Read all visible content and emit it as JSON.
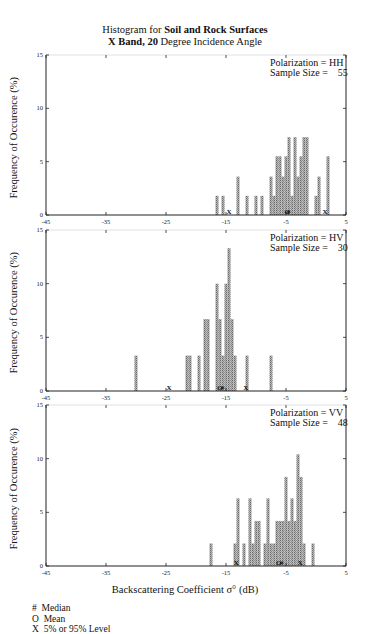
{
  "title_line1_prefix": "Histogram for ",
  "title_line1_bold": "Soil and Rock Surfaces",
  "title_line2_bold1": "X Band, 20",
  "title_line2_rest": " Degree Incidence Angle",
  "ylabel": "Frequency of Occurence (%)",
  "xlabel": "Backscattering Coefficient  σ° (dB)",
  "legend": [
    {
      "symbol": "#",
      "label": "Median"
    },
    {
      "symbol": "O",
      "label": "Mean"
    },
    {
      "symbol": "X",
      "label": "5% or 95% Level"
    }
  ],
  "chart_data": [
    {
      "type": "bar",
      "title": "Polarization = HH",
      "polarization": "HH",
      "sample_size": 55,
      "xlabel": "Backscattering Coefficient σ° (dB)",
      "ylabel": "Frequency of Occurence (%)",
      "xlim": [
        -45,
        5
      ],
      "ylim": [
        0,
        15
      ],
      "xticks": [
        -45,
        -35,
        -25,
        -15,
        -5,
        5
      ],
      "yticks": [
        0,
        5,
        10,
        15
      ],
      "bin_width_db": 1,
      "bins": [
        -16,
        -15,
        -13,
        -11,
        -10,
        -9,
        -8,
        -7,
        -6,
        -5,
        -4,
        -3,
        -2,
        -1,
        1,
        2,
        3
      ],
      "values": [
        1.8,
        1.8,
        3.6,
        1.8,
        1.8,
        1.8,
        3.6,
        5.5,
        5.5,
        7.3,
        7.3,
        5.5,
        7.3,
        1.8,
        5.5,
        1.8,
        1.8
      ],
      "detail_bins": [
        -16.5,
        -15.5,
        -13.0,
        -11.5,
        -10.0,
        -9.0,
        -7.5,
        -7.0,
        -6.5,
        -6.0,
        -5.5,
        -5.0,
        -4.5,
        -4.0,
        -3.5,
        -3.0,
        -2.5,
        -2.0,
        -1.5,
        0.0,
        0.5,
        2.0
      ],
      "detail_values": [
        1.8,
        1.8,
        3.6,
        1.8,
        1.8,
        1.8,
        3.6,
        1.8,
        5.5,
        5.5,
        3.6,
        5.5,
        7.3,
        1.8,
        7.3,
        3.6,
        5.5,
        7.3,
        7.3,
        1.8,
        3.6,
        5.5
      ],
      "markers": [
        {
          "symbol": "X",
          "x": -14.5,
          "meaning": "5% level"
        },
        {
          "symbol": "#",
          "x": -4.6,
          "meaning": "median"
        },
        {
          "symbol": "O",
          "x": -4.8,
          "meaning": "mean"
        },
        {
          "symbol": "X",
          "x": 1.5,
          "meaning": "95% level"
        }
      ]
    },
    {
      "type": "bar",
      "title": "Polarization = HV",
      "polarization": "HV",
      "sample_size": 30,
      "xlim": [
        -45,
        5
      ],
      "ylim": [
        0,
        15
      ],
      "xticks": [
        -45,
        -35,
        -25,
        -15,
        -5,
        5
      ],
      "yticks": [
        0,
        5,
        10,
        15
      ],
      "bins": [
        -30,
        -21.5,
        -21,
        -19.5,
        -18.5,
        -18,
        -16.5,
        -16,
        -15,
        -14.5,
        -14,
        -13.5,
        -11.5,
        -7.5
      ],
      "values": [
        3.3,
        3.3,
        3.3,
        3.3,
        6.7,
        6.7,
        10.0,
        6.7,
        10.0,
        13.3,
        6.7,
        3.3,
        3.3,
        3.3
      ],
      "detail_bins": [
        -30.0,
        -21.5,
        -21.0,
        -19.5,
        -18.5,
        -18.0,
        -16.5,
        -16.0,
        -15.5,
        -15.0,
        -14.5,
        -14.0,
        -13.5,
        -11.5,
        -7.5
      ],
      "detail_values": [
        3.3,
        3.3,
        3.3,
        3.3,
        6.7,
        6.7,
        10.0,
        6.7,
        3.3,
        10.0,
        13.3,
        6.7,
        3.3,
        3.3,
        3.3
      ],
      "markers": [
        {
          "symbol": "X",
          "x": -24.5,
          "meaning": "5% level"
        },
        {
          "symbol": "O",
          "x": -16.0,
          "meaning": "mean"
        },
        {
          "symbol": "#",
          "x": -15.6,
          "meaning": "median"
        },
        {
          "symbol": "X",
          "x": -11.7,
          "meaning": "95% level"
        }
      ]
    },
    {
      "type": "bar",
      "title": "Polarization = VV",
      "polarization": "VV",
      "sample_size": 48,
      "xlim": [
        -45,
        5
      ],
      "ylim": [
        0,
        15
      ],
      "xticks": [
        -45,
        -35,
        -25,
        -15,
        -5,
        5
      ],
      "yticks": [
        0,
        5,
        10,
        15
      ],
      "detail_bins": [
        -17.5,
        -13.5,
        -13.0,
        -12.0,
        -11.0,
        -10.5,
        -10.0,
        -9.5,
        -8.5,
        -8.0,
        -7.5,
        -7.0,
        -6.5,
        -6.0,
        -5.5,
        -5.0,
        -4.5,
        -4.0,
        -3.5,
        -3.0,
        -2.5,
        -2.0,
        -0.5
      ],
      "detail_values": [
        2.1,
        2.1,
        6.3,
        2.1,
        6.3,
        2.1,
        4.2,
        4.2,
        2.1,
        6.3,
        2.1,
        2.1,
        4.2,
        4.2,
        4.2,
        8.3,
        4.2,
        6.3,
        4.2,
        10.4,
        8.3,
        2.1,
        2.1
      ],
      "markers": [
        {
          "symbol": "X",
          "x": -13.3,
          "meaning": "5% level"
        },
        {
          "symbol": "O",
          "x": -6.2,
          "meaning": "mean"
        },
        {
          "symbol": "#",
          "x": -5.7,
          "meaning": "median"
        },
        {
          "symbol": "X",
          "x": -2.6,
          "meaning": "95% level"
        }
      ]
    }
  ],
  "panels": [
    {
      "pol_text": "Polarization = HH",
      "size_text": "Sample Size =    55"
    },
    {
      "pol_text": "Polarization = HV",
      "size_text": "Sample Size =    30"
    },
    {
      "pol_text": "Polarization = VV",
      "size_text": "Sample Size =    48"
    }
  ],
  "colors": {
    "bar_fill": "#9a9a9a",
    "bar_edge": "#6f6f6f",
    "axis": "#222222"
  }
}
